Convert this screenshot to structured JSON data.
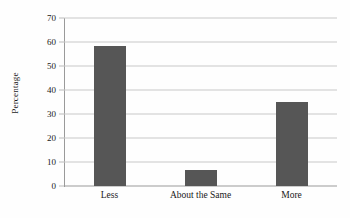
{
  "chart_data": {
    "type": "bar",
    "title": "",
    "xlabel": "",
    "ylabel": "Percentage",
    "categories": [
      "Less",
      "About the Same",
      "More"
    ],
    "values": [
      58.5,
      6.5,
      35
    ],
    "ylim": [
      0,
      70
    ],
    "ytick_step": 10,
    "yticks": [
      0,
      10,
      20,
      30,
      40,
      50,
      60,
      70
    ],
    "ytick_labels": [
      "0",
      "10",
      "20",
      "30",
      "40",
      "50",
      "60",
      "70"
    ],
    "grid": true,
    "grid_axis": "y",
    "legend": false,
    "legend_position": "none",
    "bar_color": "#565656",
    "gridline_color": "#c8c8c8",
    "axis_color": "#9a9a9a",
    "background_color": "#fefefe",
    "bar_width_px": 32
  }
}
